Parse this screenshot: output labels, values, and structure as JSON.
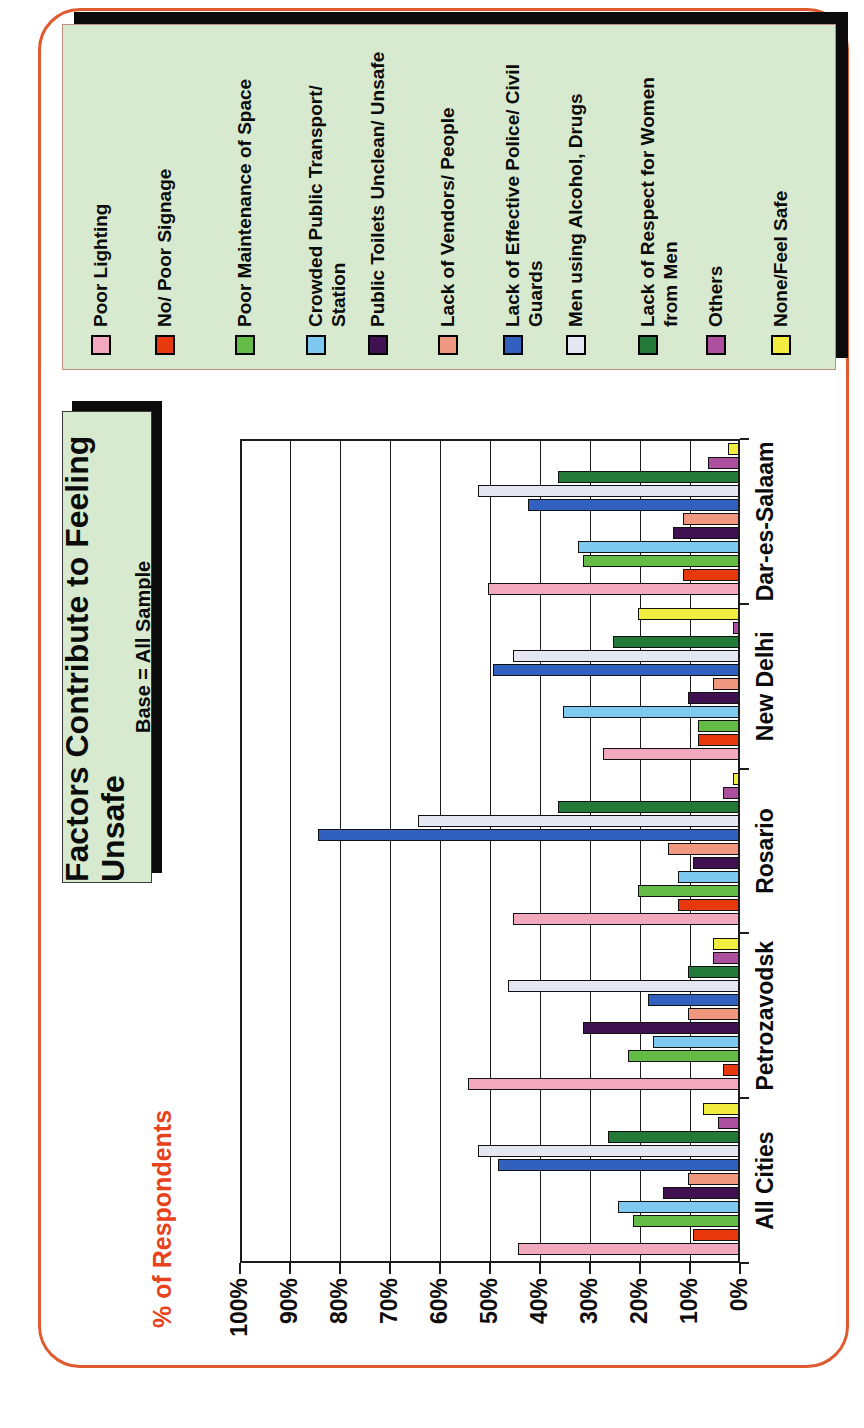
{
  "page": {
    "border_color": "#E05A30",
    "background": "#ffffff",
    "orientation_note": "landscape slide scanned rotated 90deg CCW on portrait page"
  },
  "title_box": {
    "title": "Factors Contribute to Feeling Unsafe",
    "subtitle": "Base = All Sample",
    "bg_color": "#D7E9CE",
    "shadow_color": "#0b0b0b"
  },
  "axis_title": {
    "text": "% of Respondents",
    "color": "#E8421C"
  },
  "chart_data": {
    "type": "bar",
    "orientation": "vertical-grouped",
    "title": "Factors Contribute to Feeling Unsafe",
    "subtitle": "Base = All Sample",
    "ylabel": "% of Respondents",
    "ylim": [
      0,
      100
    ],
    "ytick_step": 10,
    "yticks": [
      "0%",
      "10%",
      "20%",
      "30%",
      "40%",
      "50%",
      "60%",
      "70%",
      "80%",
      "90%",
      "100%"
    ],
    "grid": true,
    "legend_position": "right",
    "categories": [
      "All Cities",
      "Petrozavodsk",
      "Rosario",
      "New Delhi",
      "Dar-es-Salaam"
    ],
    "series": [
      {
        "name": "Poor Lighting",
        "color": "#F2A9BE",
        "label_lines": [
          "Poor Lighting"
        ],
        "values": [
          44,
          54,
          45,
          27,
          50
        ]
      },
      {
        "name": "No/ Poor Signage",
        "color": "#E8390E",
        "label_lines": [
          "No/ Poor Signage"
        ],
        "values": [
          9,
          3,
          12,
          8,
          11
        ]
      },
      {
        "name": "Poor Maintenance of Space",
        "color": "#64BB46",
        "label_lines": [
          "Poor Maintenance of Space"
        ],
        "values": [
          21,
          22,
          20,
          8,
          31
        ]
      },
      {
        "name": "Crowded Public Transport/ Station",
        "color": "#7EC9EF",
        "label_lines": [
          "Crowded Public Transport/",
          "Station"
        ],
        "values": [
          24,
          17,
          12,
          35,
          32
        ]
      },
      {
        "name": "Public Toilets Unclean/ Unsafe",
        "color": "#3F1150",
        "label_lines": [
          "Public Toilets Unclean/ Unsafe"
        ],
        "values": [
          15,
          31,
          9,
          10,
          13
        ]
      },
      {
        "name": "Lack of Vendors/ People",
        "color": "#F0977F",
        "label_lines": [
          "Lack of Vendors/ People"
        ],
        "values": [
          10,
          10,
          14,
          5,
          11
        ]
      },
      {
        "name": "Lack of Effective Police/ Civil Guards",
        "color": "#3260BE",
        "label_lines": [
          "Lack of Effective Police/ Civil",
          "Guards"
        ],
        "values": [
          48,
          18,
          84,
          49,
          42
        ]
      },
      {
        "name": "Men using Alcohol, Drugs",
        "color": "#E4E6F2",
        "label_lines": [
          "Men using Alcohol, Drugs"
        ],
        "values": [
          52,
          46,
          64,
          45,
          52
        ]
      },
      {
        "name": "Lack of Respect for Women from Men",
        "color": "#237A38",
        "label_lines": [
          "Lack of Respect for Women",
          "from Men"
        ],
        "values": [
          26,
          10,
          36,
          25,
          36
        ]
      },
      {
        "name": "Others",
        "color": "#AC4F9E",
        "label_lines": [
          "Others"
        ],
        "values": [
          4,
          5,
          3,
          1,
          6
        ]
      },
      {
        "name": "None/Feel Safe",
        "color": "#F1EC3F",
        "label_lines": [
          "None/Feel Safe"
        ],
        "values": [
          7,
          5,
          1,
          20,
          2
        ]
      }
    ]
  },
  "legend": {
    "bg_color": "#D7E9CE",
    "border_color": "#BE8D85",
    "shadow_color": "#0b0b0b"
  }
}
